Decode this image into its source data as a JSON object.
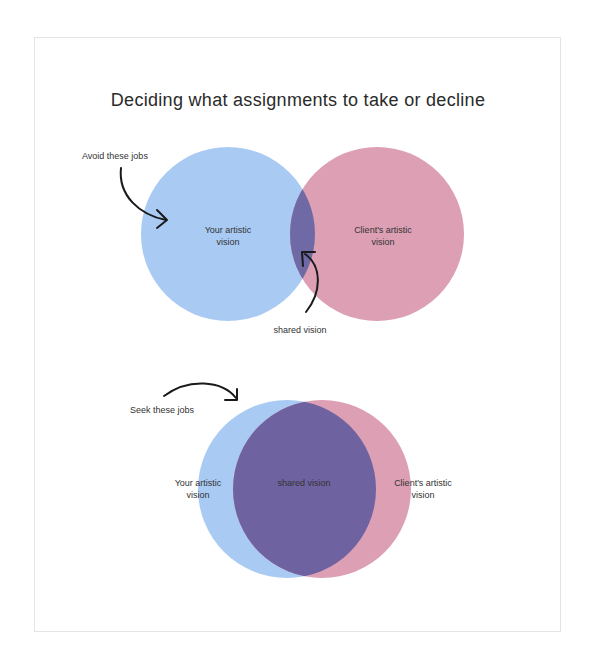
{
  "title": "Deciding what assignments to take or decline",
  "colors": {
    "your_vision": "#a9cbf3",
    "client_vision": "#dc9fb4",
    "shared_top": "#6f6aa5",
    "shared_bottom": "#6e62a0",
    "frame_border": "#e4e4e4",
    "text": "#2a2a2a",
    "arrow": "#1a1a1a"
  },
  "diagram_top": {
    "annotation": "Avoid these jobs",
    "your_vision": {
      "line1": "Your artistic",
      "line2": "vision"
    },
    "client_vision": {
      "line1": "Client's artistic",
      "line2": "vision"
    },
    "shared_label": "shared vision"
  },
  "diagram_bottom": {
    "annotation": "Seek these jobs",
    "your_vision": {
      "line1": "Your artistic",
      "line2": "vision"
    },
    "client_vision": {
      "line1": "Client's artistic",
      "line2": "vision"
    },
    "shared_label": "shared vision"
  }
}
